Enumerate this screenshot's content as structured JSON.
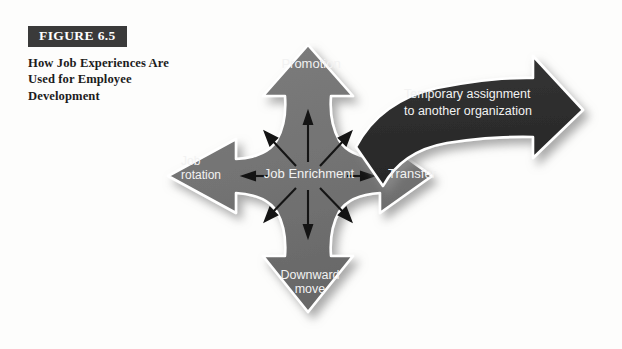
{
  "figure": {
    "number_label": "FIGURE 6.5",
    "caption": "How Job Experiences Are Used for Employee Development"
  },
  "diagram": {
    "type": "cross-arrow-diagram",
    "center_label": "Job Enrichment",
    "arms": [
      {
        "id": "up",
        "label": "Promotion",
        "direction": "up"
      },
      {
        "id": "left",
        "label": "Job rotation",
        "direction": "left",
        "line1": "Job",
        "line2": "rotation"
      },
      {
        "id": "right",
        "label": "Transfer",
        "direction": "right"
      },
      {
        "id": "down",
        "label": "Downward move",
        "direction": "down",
        "line1": "Downward",
        "line2": "move"
      }
    ],
    "callout_arrow": {
      "label": "Temporary assignment to another organization",
      "line1": "Temporary assignment",
      "line2": "to another organization",
      "direction": "right"
    },
    "radiating_arrows": 6,
    "colors": {
      "cross_fill": "#737373",
      "callout_fill": "#2e2e2e",
      "outline": "#ffffff",
      "label_text": "#f2f2f2",
      "figure_box": "#3a3a3a",
      "page_background": "#fdfdfc"
    }
  }
}
